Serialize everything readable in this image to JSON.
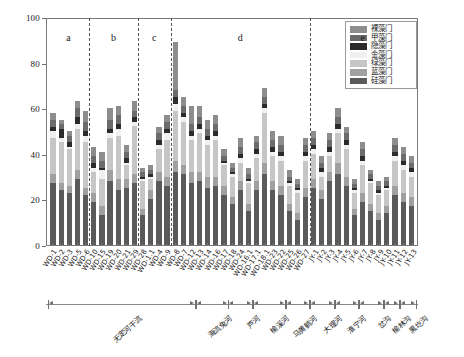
{
  "chart_data": {
    "type": "bar",
    "stacked": true,
    "title": "",
    "xlabel": "",
    "ylabel": "物种数/种",
    "ylim": [
      0,
      100
    ],
    "yticks": [
      0,
      20,
      40,
      60,
      80,
      100
    ],
    "grid": false,
    "legend_position": "top-right",
    "legend": [
      "裸藻门",
      "甲藻门",
      "隐藻门",
      "金藻门",
      "绿藻门",
      "蓝藻门",
      "硅藻门"
    ],
    "series_colors": [
      "#8d8d8d",
      "#6b6b6b",
      "#2b2b2b",
      "#f0f0f0",
      "#c6c6c6",
      "#a0a0a0",
      "#5a5a5a"
    ],
    "series_order_bottom_to_top": [
      "硅藻门",
      "蓝藻门",
      "绿藻门",
      "金藻门",
      "隐藻门",
      "甲藻门",
      "裸藻门"
    ],
    "categories": [
      "WD-1",
      "WD-2",
      "WD-3",
      "WD-5",
      "WD-6",
      "WD-10",
      "WD-15",
      "WD-19",
      "WD-20",
      "WD-21",
      "WD-29",
      "WD-28",
      "WD-1.1",
      "WD-4",
      "WD-9",
      "WD-8",
      "WD-7",
      "WD-12",
      "WD-13",
      "WD-14",
      "WD-16",
      "WD-17",
      "WD-18",
      "WD-24",
      "WD-16.1",
      "WD-17.1",
      "WD-18.1",
      "WD-23",
      "WD-22",
      "WD-25",
      "WD-26",
      "WD-27",
      "JY-1",
      "JY-2",
      "JY-3",
      "JY-4",
      "JY-5",
      "JY-6",
      "JY-7",
      "JY-8",
      "JY-9",
      "JY-10",
      "JY-11",
      "JY-12",
      "JY-13"
    ],
    "series": [
      {
        "name": "硅藻门",
        "values": [
          27,
          24,
          23,
          29,
          22,
          19,
          13,
          28,
          24,
          25,
          27,
          13,
          20,
          28,
          26,
          32,
          31,
          27,
          28,
          25,
          26,
          22,
          18,
          24,
          15,
          24,
          31,
          24,
          22,
          15,
          11,
          21,
          25,
          20,
          28,
          31,
          26,
          13,
          19,
          15,
          11,
          14,
          22,
          19,
          17
        ]
      },
      {
        "name": "蓝藻门",
        "values": [
          4,
          3,
          3,
          4,
          3,
          4,
          4,
          5,
          5,
          4,
          4,
          3,
          4,
          4,
          4,
          5,
          4,
          5,
          4,
          5,
          4,
          4,
          3,
          4,
          3,
          4,
          5,
          4,
          4,
          3,
          3,
          4,
          4,
          4,
          4,
          5,
          4,
          3,
          4,
          3,
          3,
          3,
          4,
          4,
          4
        ]
      },
      {
        "name": "绿藻门",
        "values": [
          16,
          18,
          16,
          18,
          20,
          9,
          12,
          14,
          19,
          6,
          21,
          12,
          5,
          10,
          16,
          22,
          19,
          14,
          17,
          14,
          16,
          9,
          9,
          8,
          9,
          10,
          22,
          11,
          11,
          8,
          9,
          12,
          11,
          6,
          7,
          13,
          12,
          7,
          12,
          9,
          8,
          7,
          11,
          10,
          9
        ]
      },
      {
        "name": "金藻门",
        "values": [
          3,
          2,
          1,
          2,
          3,
          2,
          4,
          2,
          3,
          1,
          2,
          1,
          1,
          2,
          3,
          3,
          2,
          2,
          2,
          2,
          2,
          1,
          1,
          2,
          1,
          2,
          2,
          2,
          2,
          1,
          1,
          2,
          2,
          2,
          2,
          2,
          2,
          1,
          2,
          1,
          1,
          1,
          2,
          2,
          2
        ]
      },
      {
        "name": "隐藻门",
        "values": [
          2,
          4,
          2,
          3,
          2,
          2,
          1,
          2,
          2,
          2,
          2,
          1,
          1,
          2,
          2,
          3,
          2,
          2,
          2,
          2,
          2,
          1,
          1,
          2,
          1,
          2,
          2,
          2,
          2,
          1,
          1,
          2,
          2,
          2,
          2,
          2,
          2,
          1,
          2,
          1,
          1,
          1,
          2,
          2,
          2
        ]
      },
      {
        "name": "甲藻门",
        "values": [
          3,
          2,
          3,
          4,
          4,
          3,
          3,
          4,
          4,
          3,
          3,
          2,
          2,
          3,
          3,
          3,
          3,
          3,
          3,
          3,
          3,
          2,
          2,
          3,
          2,
          3,
          3,
          3,
          3,
          2,
          2,
          3,
          3,
          2,
          3,
          3,
          3,
          2,
          3,
          2,
          2,
          2,
          3,
          3,
          2
        ]
      },
      {
        "name": "裸藻门",
        "values": [
          3,
          2,
          2,
          3,
          5,
          4,
          4,
          5,
          4,
          3,
          4,
          2,
          2,
          3,
          3,
          21,
          4,
          8,
          5,
          4,
          4,
          3,
          2,
          4,
          3,
          3,
          4,
          4,
          4,
          3,
          2,
          3,
          3,
          3,
          3,
          4,
          3,
          2,
          3,
          2,
          2,
          2,
          3,
          3,
          3
        ]
      }
    ],
    "group_letters": [
      {
        "label": "a",
        "left_index": 0,
        "right_index": 4
      },
      {
        "label": "b",
        "left_index": 5,
        "right_index": 10
      },
      {
        "label": "c",
        "left_index": 11,
        "right_index": 14
      },
      {
        "label": "d",
        "left_index": 15,
        "right_index": 31
      },
      {
        "label": "e",
        "left_index": 32,
        "right_index": 44
      }
    ],
    "dividers_after_index": [
      4,
      10,
      14,
      31
    ],
    "river_groups": [
      {
        "label": "无定河干流",
        "start_index": 0,
        "end_index": 17
      },
      {
        "label": "海流兔河",
        "start_index": 18,
        "end_index": 21
      },
      {
        "label": "芦河",
        "start_index": 22,
        "end_index": 24
      },
      {
        "label": "榆溪河",
        "start_index": 25,
        "end_index": 28
      },
      {
        "label": "马黄鹤河",
        "start_index": 29,
        "end_index": 31
      },
      {
        "label": "大理河",
        "start_index": 32,
        "end_index": 34
      },
      {
        "label": "淮宁河",
        "start_index": 35,
        "end_index": 37
      },
      {
        "label": "岔沟",
        "start_index": 38,
        "end_index": 40
      },
      {
        "label": "榆林沟",
        "start_index": 41,
        "end_index": 42
      },
      {
        "label": "黑圪沟",
        "start_index": 43,
        "end_index": 44
      }
    ]
  }
}
